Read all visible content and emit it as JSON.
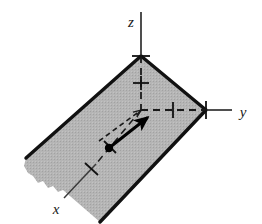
{
  "figure": {
    "background_color": "#ffffff",
    "width": 262,
    "height": 224
  },
  "colors": {
    "plane_fill": "#b3b3b3",
    "plane_edge": "#111111",
    "axis_line": "#3b3b3b",
    "dashed_axis": "#1a1a1a",
    "vector_solid": "#000000",
    "vector_dashed": "#1a1a1a",
    "point_dot": "#000000",
    "label_text": "#1a1a1a"
  },
  "axes": [
    {
      "name": "z-axis",
      "label": "z",
      "direction": "up",
      "label_position": {
        "x": 131,
        "y": 22
      },
      "solid_segment": {
        "x1": 141,
        "y1": 12,
        "x2": 141,
        "y2": 56
      },
      "dashed_segment": {
        "x1": 141,
        "y1": 56,
        "x2": 141,
        "y2": 110
      },
      "ticks": [
        {
          "name": "z-tick-origin",
          "x": 141,
          "y": 56
        },
        {
          "name": "z-tick-unit",
          "x": 141,
          "y": 83
        }
      ]
    },
    {
      "name": "y-axis",
      "label": "y",
      "direction": "right",
      "label_position": {
        "x": 243,
        "y": 113
      },
      "solid_segment": {
        "x1": 206,
        "y1": 110,
        "x2": 232,
        "y2": 110
      },
      "dashed_segment": {
        "x1": 141,
        "y1": 110,
        "x2": 206,
        "y2": 110
      },
      "ticks": [
        {
          "name": "y-tick-unit",
          "x": 173,
          "y": 110
        },
        {
          "name": "y-tick-end",
          "x": 206,
          "y": 110
        }
      ]
    },
    {
      "name": "x-axis",
      "label": "x",
      "direction": "down-left",
      "label_position": {
        "x": 56,
        "y": 211
      },
      "solid_segment": {
        "x1": 66,
        "y1": 196,
        "x2": 96,
        "y2": 164
      },
      "dashed_segment": {
        "x1": 96,
        "y1": 164,
        "x2": 141,
        "y2": 110
      },
      "ticks": [
        {
          "name": "x-tick-unit",
          "x": 91,
          "y": 169
        },
        {
          "name": "x-tick-point",
          "x": 110,
          "y": 147
        }
      ]
    }
  ],
  "plane": {
    "name": "shaded-plane",
    "fill": "#b3b3b3",
    "edge_color": "#111111",
    "edge_width": 3.2,
    "vertices": [
      {
        "x": 141,
        "y": 56
      },
      {
        "x": 206,
        "y": 110
      },
      {
        "x": 100,
        "y": 222
      },
      {
        "x": 26,
        "y": 158
      }
    ],
    "torn_edge": "bottom-left",
    "description": "Shaded parallelogram representing a plane through the origin with a ragged torn lower-left boundary"
  },
  "vector": {
    "name": "solid-vector-arrow",
    "base_point": {
      "x": 109,
      "y": 148
    },
    "tip_point": {
      "x": 148,
      "y": 117
    },
    "color": "#000000",
    "stroke_width": 3
  },
  "dashed_vector": {
    "name": "dashed-vector-arrow",
    "base_point": {
      "x": 101,
      "y": 139
    },
    "tip_point": {
      "x": 141,
      "y": 110
    },
    "color": "#1a1a1a",
    "stroke_width": 1.6
  },
  "point_marker": {
    "name": "vector-base-point",
    "x": 109,
    "y": 148,
    "radius": 4.2,
    "color": "#000000"
  }
}
